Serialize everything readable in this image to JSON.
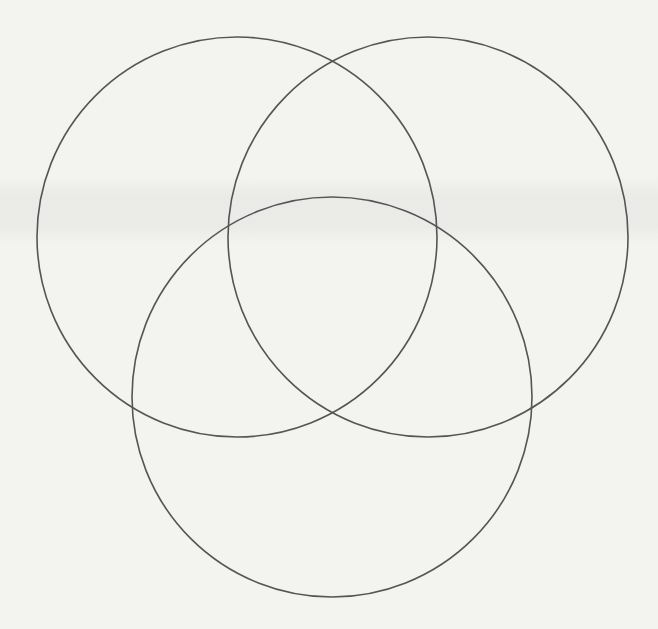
{
  "diagram": {
    "type": "venn",
    "set_count": 3,
    "labels": [],
    "stroke_color": "#555555",
    "background_color": "#f3f3f0",
    "circles": [
      {
        "name": "top-left",
        "cx": 237,
        "cy": 237,
        "r": 200
      },
      {
        "name": "top-right",
        "cx": 428,
        "cy": 237,
        "r": 200
      },
      {
        "name": "bottom",
        "cx": 332,
        "cy": 397,
        "r": 200
      }
    ]
  }
}
